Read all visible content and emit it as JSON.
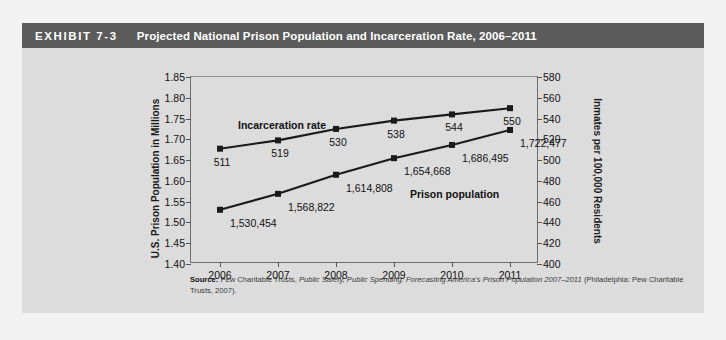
{
  "exhibit": {
    "label": "EXHIBIT 7-3",
    "title": "Projected National Prison Population and Incarceration Rate, 2006–2011",
    "header_bg": "#5b5b5b",
    "panel_bg": "#dcdcdc",
    "page_bg": "#f2f2f2"
  },
  "source_note": {
    "prefix": "Source:",
    "part1": " Pew Charitable Trusts, ",
    "italic": "Public Safety, Public Spending: Forecasting America's Prison Population 2007–2011",
    "part2": " (Philadelphia: Pew Charitable Trusts, 2007)."
  },
  "chart_data": {
    "type": "line",
    "title": "Projected National Prison Population and Incarceration Rate, 2006–2011",
    "xlabel": "",
    "categories": [
      "2006",
      "2007",
      "2008",
      "2009",
      "2010",
      "2011"
    ],
    "grid": false,
    "legend": "inline-annotations",
    "series": [
      {
        "name": "Prison population",
        "axis": "left",
        "ylabel": "U.S. Prison Population in Millions",
        "ylim": [
          1.4,
          1.85
        ],
        "yticks": [
          "1.40",
          "1.45",
          "1.50",
          "1.55",
          "1.60",
          "1.65",
          "1.70",
          "1.75",
          "1.80",
          "1.85"
        ],
        "ytick_values": [
          1.4,
          1.45,
          1.5,
          1.55,
          1.6,
          1.65,
          1.7,
          1.75,
          1.8,
          1.85
        ],
        "values": [
          1.530454,
          1.568822,
          1.614808,
          1.654668,
          1.686495,
          1.722477
        ],
        "point_labels": [
          "1,530,454",
          "1,568,822",
          "1,614,808",
          "1,654,668",
          "1,686,495",
          "1,722,477"
        ],
        "color": "#1a1a1a",
        "marker": "square"
      },
      {
        "name": "Incarceration rate",
        "axis": "right",
        "ylabel": "Inmates per 100,000 Residents",
        "ylim": [
          400,
          580
        ],
        "yticks": [
          "400",
          "420",
          "440",
          "460",
          "480",
          "500",
          "520",
          "540",
          "560",
          "580"
        ],
        "ytick_values": [
          400,
          420,
          440,
          460,
          480,
          500,
          520,
          540,
          560,
          580
        ],
        "values": [
          511,
          519,
          530,
          538,
          544,
          550
        ],
        "point_labels": [
          "511",
          "519",
          "530",
          "538",
          "544",
          "550"
        ],
        "color": "#1a1a1a",
        "marker": "square"
      }
    ]
  }
}
